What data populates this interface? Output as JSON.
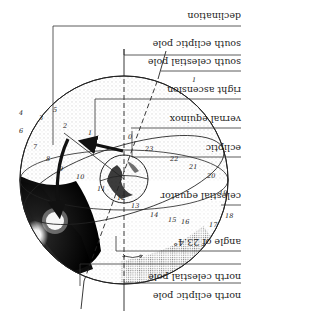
{
  "diagram": {
    "orientation": "rotated 180 degrees",
    "labels": [
      {
        "id": "north-celestial-pole",
        "text": "north celestial pole"
      },
      {
        "id": "north-ecliptic-pole",
        "text": "north ecliptic pole"
      },
      {
        "id": "angle",
        "text": "angle of 23.4°"
      },
      {
        "id": "celestial-equator",
        "text": "celestial equator"
      },
      {
        "id": "ecliptic",
        "text": "ecliptic"
      },
      {
        "id": "vernal-equinox",
        "text": "vernal equinox"
      },
      {
        "id": "right-ascension",
        "text": "right ascension"
      },
      {
        "id": "south-celestial-pole",
        "text": "south celestial pole"
      },
      {
        "id": "south-ecliptic-pole",
        "text": "south ecliptic pole"
      },
      {
        "id": "declination",
        "text": "declination"
      }
    ],
    "hour_marks": [
      "1",
      "2",
      "3",
      "4",
      "5",
      "6",
      "7",
      "8",
      "9",
      "10",
      "11",
      "12",
      "13",
      "14",
      "15",
      "16",
      "17",
      "18",
      "19",
      "20",
      "21",
      "22",
      "23",
      "0"
    ],
    "colors": {
      "ink": "#222222",
      "background": "#ffffff",
      "shadow": "#111111"
    }
  }
}
